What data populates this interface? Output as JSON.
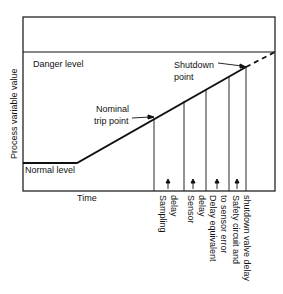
{
  "diagram": {
    "y_axis_label": "Process variable value",
    "x_axis_label": "Time",
    "levels": {
      "danger": "Danger level",
      "normal": "Normal level"
    },
    "points": {
      "nominal_trip_line1": "Nominal",
      "nominal_trip_line2": "trip point",
      "shutdown_line1": "Shutdown",
      "shutdown_line2": "point"
    },
    "delays": [
      {
        "line1": "Sampling",
        "line2": "delay"
      },
      {
        "line1": "Sensor",
        "line2": "delay"
      },
      {
        "line1": "Delay equivalent",
        "line2": "to sensor error"
      },
      {
        "line1": "Safety circuit and",
        "line2": "shutdown valve delay"
      }
    ]
  }
}
